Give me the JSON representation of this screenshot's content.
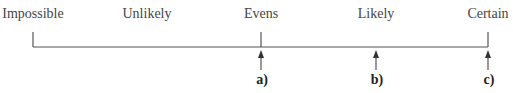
{
  "scale": {
    "labels": [
      {
        "text": "Impossible",
        "x": 33
      },
      {
        "text": "Unlikely",
        "x": 147
      },
      {
        "text": "Evens",
        "x": 261
      },
      {
        "text": "Likely",
        "x": 376
      },
      {
        "text": "Certain",
        "x": 488
      }
    ],
    "line": {
      "x_start": 33,
      "x_end": 488,
      "y": 47,
      "color": "#555555"
    }
  },
  "markers": [
    {
      "label": "a)",
      "x": 261
    },
    {
      "label": "b)",
      "x": 376
    },
    {
      "label": "c)",
      "x": 488
    }
  ]
}
